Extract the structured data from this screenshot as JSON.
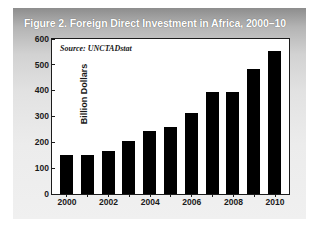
{
  "figure": {
    "title": "Figure 2. Foreign Direct Investment in Africa, 2000–10",
    "source_note": "Source: UNCTADstat",
    "panel_background": "#d8d8d8",
    "title_text_color": "#ffffff",
    "bar_color": "#000000",
    "plot_background": "#ffffff",
    "axis_color": "#1c1c1c"
  },
  "chart_data": {
    "type": "bar",
    "title": "Figure 2. Foreign Direct Investment in Africa, 2000–10",
    "subtitle": "Source: UNCTADstat",
    "xlabel": "",
    "ylabel": "Billion Dollars",
    "categories": [
      "2000",
      "2001",
      "2002",
      "2003",
      "2004",
      "2005",
      "2006",
      "2007",
      "2008",
      "2009",
      "2010"
    ],
    "values": [
      152,
      150,
      167,
      205,
      242,
      258,
      315,
      393,
      393,
      485,
      553
    ],
    "ylim": [
      0,
      600
    ],
    "yticks": [
      0,
      100,
      200,
      300,
      400,
      500,
      600
    ],
    "ytick_labels": [
      "0",
      "100",
      "200",
      "300",
      "400",
      "500",
      "600"
    ],
    "xtick_labels_shown": [
      "2000",
      "2002",
      "2004",
      "2006",
      "2008",
      "2010"
    ],
    "grid": false,
    "legend": false,
    "legend_position": "none",
    "series": [
      {
        "name": "Foreign Direct Investment",
        "color": "#000000",
        "values": [
          152,
          150,
          167,
          205,
          242,
          258,
          315,
          393,
          393,
          485,
          553
        ]
      }
    ]
  }
}
